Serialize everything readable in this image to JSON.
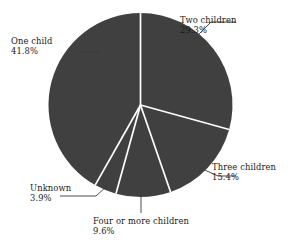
{
  "chart_data": {
    "type": "pie",
    "title": "",
    "subtitle": "",
    "xlabel": "",
    "ylabel": "",
    "legend_position": "none",
    "grid": false,
    "start_angle_deg": 0,
    "direction": "clockwise",
    "categories": [
      "Two children",
      "Three children",
      "Four or more children",
      "Unknown",
      "One child"
    ],
    "values": [
      29.3,
      15.4,
      9.6,
      3.9,
      41.8
    ],
    "value_unit": "%",
    "slices": [
      {
        "label": "Two children",
        "percent": 29.3,
        "percent_text": "29.3%"
      },
      {
        "label": "Three children",
        "percent": 15.4,
        "percent_text": "15.4%"
      },
      {
        "label": "Four or more children",
        "percent": 9.6,
        "percent_text": "9.6%"
      },
      {
        "label": "Unknown",
        "percent": 3.9,
        "percent_text": "3.9%"
      },
      {
        "label": "One child",
        "percent": 41.8,
        "percent_text": "41.8%"
      }
    ],
    "colors": {
      "slice_fill": "#404040",
      "slice_divider": "#ffffff",
      "leader_line": "#3a3a3a",
      "text": "#1a1a1a",
      "background": "#ffffff"
    }
  },
  "labels": {
    "two_children": {
      "name": "Two children",
      "percent": "29.3%"
    },
    "one_child": {
      "name": "One child",
      "percent": "41.8%"
    },
    "three_children": {
      "name": "Three children",
      "percent": "15.4%"
    },
    "four_or_more_children": {
      "name": "Four or more children",
      "percent": "9.6%"
    },
    "unknown": {
      "name": "Unknown",
      "percent": "3.9%"
    }
  }
}
